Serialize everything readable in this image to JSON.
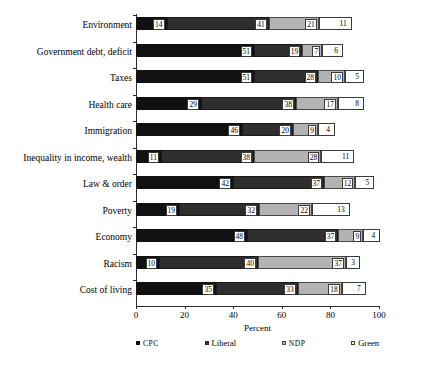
{
  "chart_data": {
    "type": "bar",
    "orientation": "horizontal",
    "stacked": true,
    "title": "",
    "xlabel": "Percent",
    "ylabel": "",
    "xlim": [
      0,
      100
    ],
    "xticks": [
      "0",
      "20",
      "40",
      "60",
      "80",
      "100"
    ],
    "grid": false,
    "legend_position": "bottom",
    "categories": [
      "Environment",
      "Government debt, deficit",
      "Taxes",
      "Health care",
      "Immigration",
      "Inequality in income, wealth",
      "Law & order",
      "Poverty",
      "Economy",
      "Racism",
      "Cost of living"
    ],
    "series": [
      {
        "name": "CPC",
        "values": [
          14,
          51,
          51,
          29,
          46,
          11,
          42,
          19,
          48,
          10,
          35
        ]
      },
      {
        "name": "Liberal",
        "values": [
          41,
          19,
          28,
          38,
          20,
          38,
          37,
          32,
          37,
          40,
          33
        ]
      },
      {
        "name": "NDP",
        "values": [
          21,
          7,
          10,
          17,
          9,
          28,
          12,
          22,
          9,
          37,
          18
        ]
      },
      {
        "name": "Green",
        "values": [
          11,
          6,
          5,
          8,
          4,
          11,
          5,
          13,
          4,
          3,
          7
        ]
      }
    ],
    "series_colors": {
      "CPC": "#111111",
      "Liberal": "#2e2e2e",
      "NDP": "#b3b3b3",
      "Green": "#ffffff"
    },
    "rows": [
      {
        "label": "Environment",
        "segments": [
          {
            "series": "CPC",
            "label": "14",
            "width": 12.6
          },
          {
            "series": "Liberal",
            "label": "41",
            "width": 42.0
          },
          {
            "series": "NDP",
            "label": "21",
            "width": 20.6
          },
          {
            "series": "Green",
            "label": "11",
            "width": 13.6
          }
        ]
      },
      {
        "label": "Government debt, deficit",
        "segments": [
          {
            "series": "CPC",
            "label": "51",
            "width": 48.6
          },
          {
            "series": "Liberal",
            "label": "19",
            "width": 19.8
          },
          {
            "series": "NDP",
            "label": "7",
            "width": 8.2
          },
          {
            "series": "Green",
            "label": "6",
            "width": 8.6
          }
        ]
      },
      {
        "label": "Taxes",
        "segments": [
          {
            "series": "CPC",
            "label": "51",
            "width": 48.6
          },
          {
            "series": "Liberal",
            "label": "28",
            "width": 26.3
          },
          {
            "series": "NDP",
            "label": "10",
            "width": 11.1
          },
          {
            "series": "Green",
            "label": "5",
            "width": 7.8
          }
        ]
      },
      {
        "label": "Health care",
        "segments": [
          {
            "series": "CPC",
            "label": "29",
            "width": 26.7
          },
          {
            "series": "Liberal",
            "label": "38",
            "width": 39.1
          },
          {
            "series": "NDP",
            "label": "17",
            "width": 17.3
          },
          {
            "series": "Green",
            "label": "8",
            "width": 10.7
          }
        ]
      },
      {
        "label": "Immigration",
        "segments": [
          {
            "series": "CPC",
            "label": "46",
            "width": 43.6
          },
          {
            "series": "Liberal",
            "label": "20",
            "width": 21.0
          },
          {
            "series": "NDP",
            "label": "9",
            "width": 10.3
          },
          {
            "series": "Green",
            "label": "4",
            "width": 7.0
          }
        ]
      },
      {
        "label": "Inequality in income, wealth",
        "segments": [
          {
            "series": "CPC",
            "label": "11",
            "width": 10.3
          },
          {
            "series": "Liberal",
            "label": "38",
            "width": 38.3
          },
          {
            "series": "NDP",
            "label": "28",
            "width": 27.6
          },
          {
            "series": "Green",
            "label": "11",
            "width": 13.6
          }
        ]
      },
      {
        "label": "Law & order",
        "segments": [
          {
            "series": "CPC",
            "label": "42",
            "width": 39.9
          },
          {
            "series": "Liberal",
            "label": "37",
            "width": 37.5
          },
          {
            "series": "NDP",
            "label": "12",
            "width": 12.8
          },
          {
            "series": "Green",
            "label": "5",
            "width": 7.8
          }
        ]
      },
      {
        "label": "Poverty",
        "segments": [
          {
            "series": "CPC",
            "label": "19",
            "width": 17.7
          },
          {
            "series": "Liberal",
            "label": "32",
            "width": 32.9
          },
          {
            "series": "NDP",
            "label": "22",
            "width": 21.8
          },
          {
            "series": "Green",
            "label": "13",
            "width": 15.6
          }
        ]
      },
      {
        "label": "Economy",
        "segments": [
          {
            "series": "CPC",
            "label": "48",
            "width": 45.7
          },
          {
            "series": "Liberal",
            "label": "37",
            "width": 37.5
          },
          {
            "series": "NDP",
            "label": "9",
            "width": 10.3
          },
          {
            "series": "Green",
            "label": "4",
            "width": 7.0
          }
        ]
      },
      {
        "label": "Racism",
        "segments": [
          {
            "series": "CPC",
            "label": "10",
            "width": 9.5
          },
          {
            "series": "Liberal",
            "label": "40",
            "width": 40.7
          },
          {
            "series": "NDP",
            "label": "37",
            "width": 36.2
          },
          {
            "series": "Green",
            "label": "3",
            "width": 5.8
          }
        ]
      },
      {
        "label": "Cost of living",
        "segments": [
          {
            "series": "CPC",
            "label": "35",
            "width": 32.9
          },
          {
            "series": "Liberal",
            "label": "33",
            "width": 33.7
          },
          {
            "series": "NDP",
            "label": "18",
            "width": 18.1
          },
          {
            "series": "Green",
            "label": "7",
            "width": 9.9
          }
        ]
      }
    ],
    "legend": [
      {
        "name": "CPC",
        "style": "smallcaps"
      },
      {
        "name": "Liberal",
        "style": "normal"
      },
      {
        "name": "NDP",
        "style": "smallcaps"
      },
      {
        "name": "Green",
        "style": "normal"
      }
    ]
  }
}
